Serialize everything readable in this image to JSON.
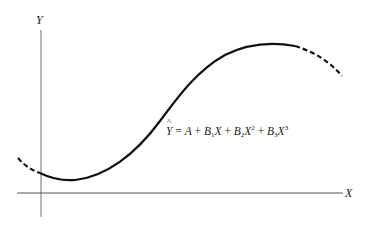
{
  "diagram": {
    "type": "cubic-regression-curve",
    "axes": {
      "y_label": "Y",
      "x_label": "X"
    },
    "equation": {
      "lhs": "Ŷ",
      "text": "Ŷ = A + B1X + B2X2 + B3X3",
      "parts": {
        "yhat": "Y",
        "eq": " = ",
        "a": "A",
        "plus1": " + ",
        "b1": "B",
        "b1_sub": "1",
        "x1": "X",
        "plus2": " + ",
        "b2": "B",
        "b2_sub": "2",
        "x2": "X",
        "x2_sup": "2",
        "plus3": " + ",
        "b3": "B",
        "b3_sub": "3",
        "x3": "X",
        "x3_sup": "3"
      }
    },
    "curve": {
      "style_solid_segment": "observed range",
      "style_dashed_segments": "extrapolation at both ends",
      "color": "#111111"
    }
  }
}
